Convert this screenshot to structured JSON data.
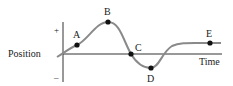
{
  "diagram": {
    "y_axis_label": "Position",
    "x_axis_label": "Time",
    "plus_sign": "+",
    "minus_sign": "–",
    "curve_color": "#8a8a8a",
    "axis_color": "#333333",
    "points": [
      {
        "label": "A",
        "x": 77,
        "y": 45,
        "label_x": 73,
        "label_y": 38
      },
      {
        "label": "B",
        "x": 108,
        "y": 22,
        "label_x": 104,
        "label_y": 15
      },
      {
        "label": "C",
        "x": 131,
        "y": 54,
        "label_x": 135,
        "label_y": 51
      },
      {
        "label": "D",
        "x": 151,
        "y": 68,
        "label_x": 147,
        "label_y": 82
      },
      {
        "label": "E",
        "x": 210,
        "y": 43,
        "label_x": 206,
        "label_y": 37
      }
    ]
  }
}
